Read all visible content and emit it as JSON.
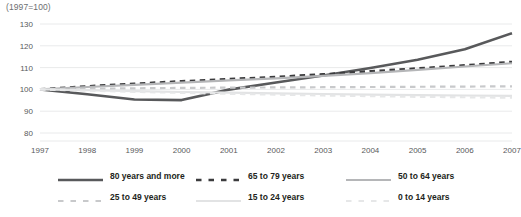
{
  "axis_note": "(1997=100)",
  "legend": {
    "rows": [
      [
        {
          "label": "80 years and more",
          "color": "#58595b",
          "style": "solid",
          "width": 2.6
        },
        {
          "label": "65 to 79 years",
          "color": "#3b3b3d",
          "style": "dashed",
          "width": 2.6
        },
        {
          "label": "50 to 64 years",
          "color": "#b5b6b8",
          "style": "solid",
          "width": 2.2
        }
      ],
      [
        {
          "label": "25 to 49 years",
          "color": "#c8c9cb",
          "style": "dashed",
          "width": 2.2
        },
        {
          "label": "15 to 24 years",
          "color": "#e2e3e4",
          "style": "solid",
          "width": 2.2
        },
        {
          "label": "0 to 14 years",
          "color": "#e6e7e8",
          "style": "dashed",
          "width": 2.2
        }
      ]
    ]
  },
  "chart_data": {
    "type": "line",
    "title": "",
    "subtitle": "(1997=100)",
    "xlabel": "",
    "ylabel": "",
    "grid": true,
    "legend_position": "bottom",
    "x": [
      1997,
      1998,
      1999,
      2000,
      2001,
      2002,
      2003,
      2004,
      2005,
      2006,
      2007
    ],
    "xlim": [
      1997,
      2007
    ],
    "ylim": [
      80,
      130
    ],
    "yticks": [
      80,
      90,
      100,
      110,
      120,
      130
    ],
    "xticks": [
      "1997",
      "1998",
      "1999",
      "2000",
      "2001",
      "2002",
      "2003",
      "2004",
      "2005",
      "2006",
      "2007"
    ],
    "series": [
      {
        "name": "80 years and more",
        "color": "#58595b",
        "style": "solid",
        "width": 2.6,
        "values": [
          100.0,
          97.8,
          95.4,
          95.1,
          99.9,
          103.2,
          106.4,
          109.8,
          113.6,
          118.4,
          125.8
        ]
      },
      {
        "name": "65 to 79 years",
        "color": "#3b3b3d",
        "style": "dashed",
        "width": 2.6,
        "values": [
          100.0,
          101.4,
          102.6,
          103.7,
          104.7,
          105.7,
          106.9,
          108.3,
          109.6,
          111.0,
          112.6
        ]
      },
      {
        "name": "50 to 64 years",
        "color": "#b5b6b8",
        "style": "solid",
        "width": 2.2,
        "values": [
          100.0,
          101.1,
          102.1,
          103.1,
          104.1,
          105.1,
          106.2,
          107.5,
          109.0,
          110.5,
          112.0
        ]
      },
      {
        "name": "25 to 49 years",
        "color": "#c8c9cb",
        "style": "dashed",
        "width": 2.2,
        "values": [
          100.0,
          100.3,
          100.5,
          100.7,
          100.8,
          100.9,
          101.0,
          101.1,
          101.2,
          101.3,
          101.4
        ]
      },
      {
        "name": "15 to 24 years",
        "color": "#e2e3e4",
        "style": "solid",
        "width": 2.2,
        "values": [
          100.0,
          99.6,
          99.2,
          98.8,
          98.5,
          98.2,
          97.9,
          97.6,
          97.4,
          97.2,
          97.0
        ]
      },
      {
        "name": "0 to 14 years",
        "color": "#e6e7e8",
        "style": "dashed",
        "width": 2.2,
        "values": [
          100.0,
          99.4,
          98.9,
          98.4,
          98.0,
          97.6,
          97.2,
          96.9,
          96.6,
          96.4,
          96.2
        ]
      }
    ]
  }
}
